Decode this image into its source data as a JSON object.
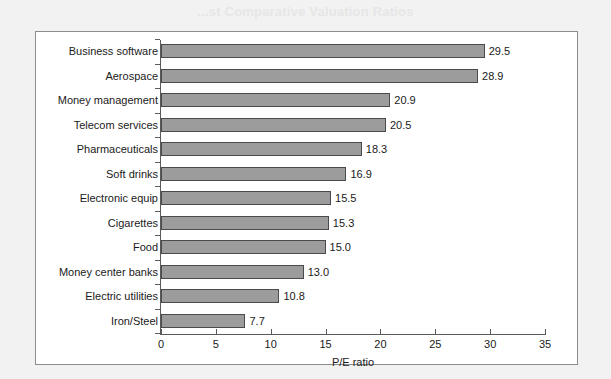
{
  "page": {
    "heading": "...st Comparative Valuation Ratios",
    "background_color": "#f2f2f2"
  },
  "figure": {
    "frame_border_color": "#8d8d8d",
    "plot_background_color": "#ffffff"
  },
  "chart_data": {
    "type": "bar",
    "orientation": "horizontal",
    "title": "",
    "subtitle": "",
    "xlabel": "P/E ratio",
    "ylabel": "",
    "xlim": [
      0,
      35
    ],
    "xticks": [
      "0",
      "5",
      "10",
      "15",
      "20",
      "25",
      "30",
      "35"
    ],
    "xtick_values": [
      0,
      5,
      10,
      15,
      20,
      25,
      30,
      35
    ],
    "grid": false,
    "legend": false,
    "legend_position": "none",
    "bar_fill_color": "#9c9c9c",
    "bar_border_color": "#4a4a4a",
    "axis_color": "#5a5a5a",
    "categories": [
      "Business software",
      "Aerospace",
      "Money management",
      "Telecom services",
      "Pharmaceuticals",
      "Soft drinks",
      "Electronic equip",
      "Cigarettes",
      "Food",
      "Money center banks",
      "Electric utilities",
      "Iron/Steel"
    ],
    "values": [
      29.5,
      28.9,
      20.9,
      20.5,
      18.3,
      16.9,
      15.5,
      15.3,
      15.0,
      13.0,
      10.8,
      7.7
    ],
    "value_labels": [
      "29.5",
      "28.9",
      "20.9",
      "20.5",
      "18.3",
      "16.9",
      "15.5",
      "15.3",
      "15.0",
      "13.0",
      "10.8",
      "7.7"
    ]
  }
}
